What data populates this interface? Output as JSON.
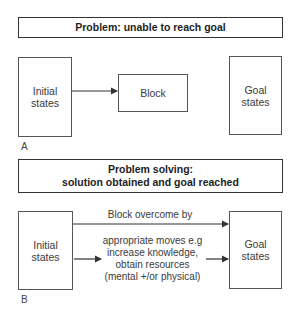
{
  "panel_a": {
    "label": "A",
    "title": "Problem: unable to reach goal",
    "initial": [
      "Initial",
      "states"
    ],
    "block": "Block",
    "goal": [
      "Goal",
      "states"
    ]
  },
  "panel_b": {
    "label": "B",
    "title": [
      "Problem solving:",
      "solution obtained and goal reached"
    ],
    "initial": [
      "Initial",
      "states"
    ],
    "goal": [
      "Goal",
      "states"
    ],
    "top_arrow_label": "Block overcome by",
    "moves": [
      "appropriate moves e.g",
      "increase knowledge,",
      "obtain resources",
      "(mental +/or physical)"
    ]
  },
  "colors": {
    "line": "#333333",
    "text": "#2a2a2a"
  }
}
